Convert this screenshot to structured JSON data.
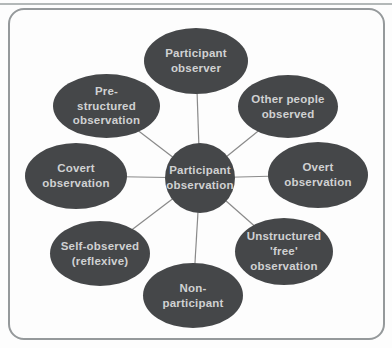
{
  "diagram": {
    "title": "Participant observation spider diagram",
    "center": {
      "label": "Participant\nobservation"
    },
    "nodes": [
      {
        "id": "participant-observer",
        "label": "Participant\nobserver"
      },
      {
        "id": "other-people-observed",
        "label": "Other people\nobserved"
      },
      {
        "id": "overt-observation",
        "label": "Overt\nobservation"
      },
      {
        "id": "unstructured-free-observation",
        "label": "Unstructured\n'free'\nobservation"
      },
      {
        "id": "non-participant",
        "label": "Non-\nparticipant"
      },
      {
        "id": "self-observed-reflexive",
        "label": "Self-observed\n(reflexive)"
      },
      {
        "id": "covert-observation",
        "label": "Covert\nobservation"
      },
      {
        "id": "pre-structured-observation",
        "label": "Pre-\nstructured\nobservation"
      }
    ],
    "colors": {
      "node_fill": "#454749",
      "node_text": "#d0d1d2",
      "connector": "#8a8a8a",
      "frame_border": "#95999b",
      "background": "#fdfdfd"
    }
  }
}
